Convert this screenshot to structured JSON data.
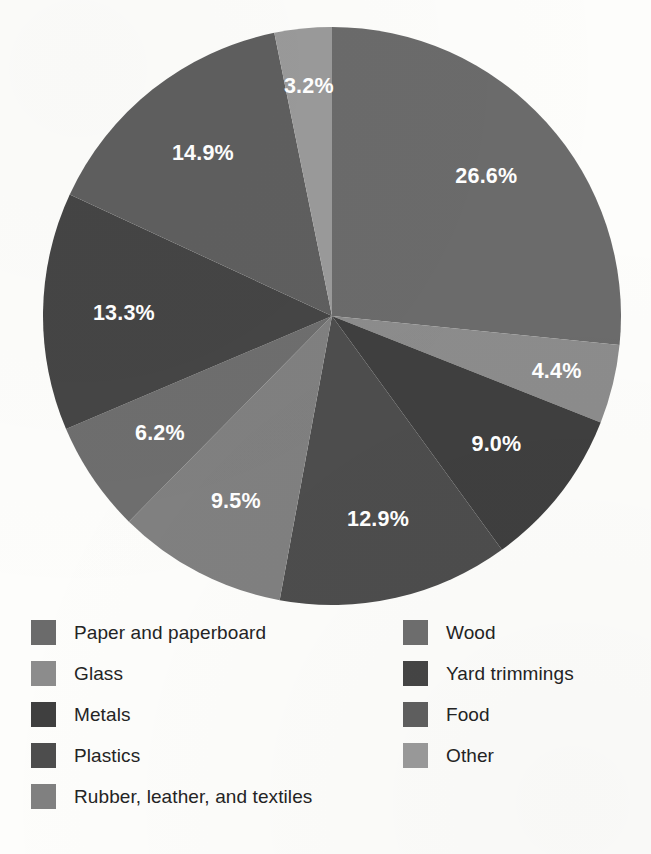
{
  "chart_data": {
    "type": "pie",
    "title": "",
    "subtitle": "",
    "xlabel": "",
    "ylabel": "",
    "grid": false,
    "legend_position": "bottom",
    "start_angle_deg": 90,
    "direction": "clockwise",
    "value_unit": "%",
    "total": 99.9,
    "slices": [
      {
        "label": "Paper and paperboard",
        "value": 26.6,
        "data_label": "26.6%",
        "color": "#6b6b6b"
      },
      {
        "label": "Glass",
        "value": 4.4,
        "data_label": "4.4%",
        "color": "#8c8c8c"
      },
      {
        "label": "Metals",
        "value": 9.0,
        "data_label": "9.0%",
        "color": "#3f3f3f"
      },
      {
        "label": "Plastics",
        "value": 12.9,
        "data_label": "12.9%",
        "color": "#4d4d4d"
      },
      {
        "label": "Rubber, leather, and textiles",
        "value": 9.5,
        "data_label": "9.5%",
        "color": "#808080"
      },
      {
        "label": "Wood",
        "value": 6.2,
        "data_label": "6.2%",
        "color": "#6e6e6e"
      },
      {
        "label": "Yard trimmings",
        "value": 13.3,
        "data_label": "13.3%",
        "color": "#454545"
      },
      {
        "label": "Food",
        "value": 14.9,
        "data_label": "14.9%",
        "color": "#5f5f5f"
      },
      {
        "label": "Other",
        "value": 3.2,
        "data_label": "3.2%",
        "color": "#9a9a9a"
      }
    ]
  },
  "legend": {
    "columns": [
      {
        "items": [
          {
            "label": "Paper and paperboard",
            "color": "#6b6b6b"
          },
          {
            "label": "Glass",
            "color": "#8c8c8c"
          },
          {
            "label": "Metals",
            "color": "#3f3f3f"
          },
          {
            "label": "Plastics",
            "color": "#4d4d4d"
          },
          {
            "label": "Rubber, leather, and textiles",
            "color": "#808080"
          }
        ]
      },
      {
        "items": [
          {
            "label": "Wood",
            "color": "#6e6e6e"
          },
          {
            "label": "Yard trimmings",
            "color": "#454545"
          },
          {
            "label": "Food",
            "color": "#5f5f5f"
          },
          {
            "label": "Other",
            "color": "#9a9a9a"
          }
        ]
      }
    ]
  },
  "geometry": {
    "center_x": 332,
    "center_y": 316,
    "radius": 289,
    "label_radius_ratio": 0.72
  }
}
